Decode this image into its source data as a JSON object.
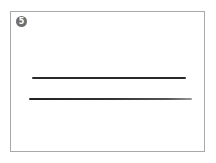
{
  "card": {
    "badge_number": "5",
    "lines": [
      {
        "name": "line-1"
      },
      {
        "name": "line-2"
      }
    ]
  }
}
